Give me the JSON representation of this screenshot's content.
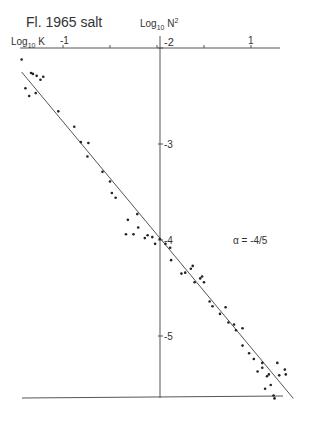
{
  "chart_data": {
    "type": "scatter",
    "title": "Fl. 1965 salt",
    "xlabel": "Log10 K",
    "ylabel": "Log10 N^2",
    "xlim": [
      -1.45,
      1.45
    ],
    "ylim": [
      -5.6,
      -2.0
    ],
    "x_ticks": [
      -1,
      -0.5,
      0,
      0.5,
      1
    ],
    "x_tick_labels": [
      "-1",
      "",
      "",
      "",
      "1"
    ],
    "y_ticks": [
      -2,
      -3,
      -4,
      -5
    ],
    "y_tick_labels": [
      "-2",
      "-3",
      "-4",
      "-5"
    ],
    "grid": false,
    "legend": null,
    "annotation": "α = -4/5",
    "fit_line": {
      "slope": -0.8,
      "x": [
        -1.44,
        1.45
      ],
      "y": [
        -2.25,
        -5.65
      ]
    },
    "series": [
      {
        "name": "Fl. 1965 salt observations",
        "points": [
          [
            -1.44,
            -2.12
          ],
          [
            -1.34,
            -2.26
          ],
          [
            -1.28,
            -2.29
          ],
          [
            -1.21,
            -2.3
          ],
          [
            -1.4,
            -2.42
          ],
          [
            -1.36,
            -2.5
          ],
          [
            -1.29,
            -2.47
          ],
          [
            -1.24,
            -2.33
          ],
          [
            -1.32,
            -2.27
          ],
          [
            -1.05,
            -2.66
          ],
          [
            -0.88,
            -2.82
          ],
          [
            -0.81,
            -2.98
          ],
          [
            -0.73,
            -2.99
          ],
          [
            -0.74,
            -3.13
          ],
          [
            -0.58,
            -3.29
          ],
          [
            -0.5,
            -3.39
          ],
          [
            -0.48,
            -3.51
          ],
          [
            -0.44,
            -3.56
          ],
          [
            -0.31,
            -3.79
          ],
          [
            -0.33,
            -3.94
          ],
          [
            -0.25,
            -3.94
          ],
          [
            -0.2,
            -3.87
          ],
          [
            -0.21,
            -3.73
          ],
          [
            -0.13,
            -3.98
          ],
          [
            -0.1,
            -3.95
          ],
          [
            -0.05,
            -3.97
          ],
          [
            -0.02,
            -4.04
          ],
          [
            0.03,
            -3.99
          ],
          [
            0.09,
            -4.04
          ],
          [
            0.14,
            -4.08
          ],
          [
            0.15,
            -4.21
          ],
          [
            0.26,
            -4.35
          ],
          [
            0.3,
            -4.34
          ],
          [
            0.36,
            -4.3
          ],
          [
            0.38,
            -4.27
          ],
          [
            0.4,
            -4.44
          ],
          [
            0.46,
            -4.4
          ],
          [
            0.48,
            -4.38
          ],
          [
            0.5,
            -4.44
          ],
          [
            0.56,
            -4.64
          ],
          [
            0.59,
            -4.69
          ],
          [
            0.67,
            -4.77
          ],
          [
            0.73,
            -4.7
          ],
          [
            0.76,
            -4.86
          ],
          [
            0.82,
            -4.88
          ],
          [
            0.84,
            -4.94
          ],
          [
            0.91,
            -4.92
          ],
          [
            0.91,
            -5.1
          ],
          [
            0.98,
            -5.18
          ],
          [
            1.03,
            -5.24
          ],
          [
            1.12,
            -5.28
          ],
          [
            1.07,
            -5.37
          ],
          [
            1.12,
            -5.33
          ],
          [
            1.17,
            -5.42
          ],
          [
            1.19,
            -5.4
          ],
          [
            1.21,
            -5.51
          ],
          [
            1.28,
            -5.28
          ],
          [
            1.3,
            -5.41
          ],
          [
            1.36,
            -5.35
          ],
          [
            1.37,
            -5.4
          ],
          [
            1.15,
            -5.55
          ],
          [
            1.24,
            -5.62
          ],
          [
            1.25,
            -5.65
          ]
        ]
      }
    ]
  },
  "labels": {
    "title": "Fl. 1965 salt",
    "y_axis_base": "Log",
    "y_axis_sub": "10",
    "y_axis_var": "N",
    "y_axis_sup": "2",
    "x_axis_base": "Log",
    "x_axis_sub": "10",
    "x_axis_var": "K",
    "annotation": "α = -4/5"
  }
}
